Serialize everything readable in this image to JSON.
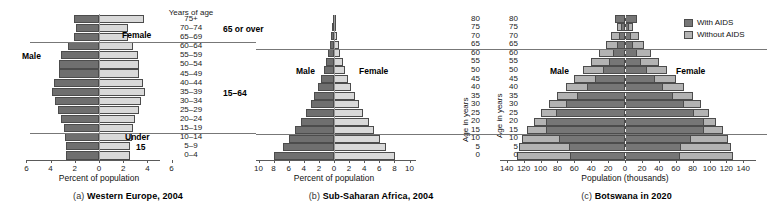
{
  "figure": {
    "panels": [
      {
        "id": "(a)",
        "caption": "Western Europe, 2004",
        "male_label": "Male",
        "female_label": "Female",
        "age_axis_header": "Years of age",
        "x_axis_title": "Percent of population",
        "group_labels": {
          "over65": "65 or over",
          "mid": "15–64",
          "under15_line1": "Under",
          "under15_line2": "15"
        }
      },
      {
        "id": "(b)",
        "caption": "Sub-Saharan Africa, 2004",
        "male_label": "Male",
        "female_label": "Female",
        "x_axis_title": "Percent of population",
        "y_axis_title": "Age in years"
      },
      {
        "id": "(c)",
        "caption": "Botswana in 2020",
        "male_label": "Male",
        "female_label": "Female",
        "x_axis_title": "Population (thousands)",
        "y_axis_title": "Age in years",
        "legend": [
          {
            "label": "With AIDS",
            "swatch": "with-aids-swatch"
          },
          {
            "label": "Without AIDS",
            "swatch": "without-aids-swatch"
          }
        ]
      }
    ]
  },
  "colors": {
    "male_dark": "#6f6f6f",
    "female_light": "#d9d9d9",
    "with_aids": "#767676",
    "without_aids": "#b3b3b3",
    "axis": "#5a5a5a",
    "divider": "#777777"
  },
  "chart_data": [
    {
      "type": "bar",
      "title": "Western Europe, 2004",
      "subtitle": "(a)",
      "orientation": "horizontal-pyramid",
      "xlabel": "Percent of population",
      "ylabel": "Years of age",
      "xlim": [
        -6,
        6
      ],
      "xticks": [
        6,
        4,
        2,
        0,
        2,
        4,
        6
      ],
      "grid": false,
      "legend_position": "none",
      "categories": [
        "0–4",
        "5–9",
        "10–14",
        "15–19",
        "20–24",
        "25–29",
        "30–34",
        "35–39",
        "40–44",
        "45–49",
        "50–54",
        "55–59",
        "60–64",
        "65–69",
        "70–74",
        "75+"
      ],
      "series": [
        {
          "name": "Male",
          "values": [
            2.7,
            2.7,
            2.8,
            2.9,
            3.1,
            3.4,
            3.6,
            3.9,
            3.7,
            3.3,
            3.3,
            3.1,
            2.6,
            2.1,
            1.9,
            2.1
          ]
        },
        {
          "name": "Female",
          "values": [
            2.6,
            2.6,
            2.7,
            2.8,
            3.0,
            3.3,
            3.5,
            3.8,
            3.6,
            3.3,
            3.3,
            3.2,
            2.8,
            2.4,
            2.4,
            3.7
          ]
        }
      ],
      "annotations": [
        "Male",
        "Female",
        "65 or over",
        "15–64",
        "Under 15"
      ]
    },
    {
      "type": "bar",
      "title": "Sub-Saharan Africa, 2004",
      "subtitle": "(b)",
      "orientation": "horizontal-pyramid",
      "xlabel": "Percent of population",
      "ylabel": "Age in years",
      "xlim": [
        -10,
        10
      ],
      "xticks": [
        10,
        8,
        6,
        4,
        2,
        0,
        2,
        4,
        6,
        8,
        10
      ],
      "grid": false,
      "legend_position": "none",
      "categories": [
        "0",
        "5",
        "10",
        "15",
        "20",
        "25",
        "30",
        "35",
        "40",
        "45",
        "50",
        "55",
        "60",
        "65",
        "70",
        "75",
        "80"
      ],
      "series": [
        {
          "name": "Male",
          "values": [
            7.9,
            6.8,
            5.9,
            5.1,
            4.4,
            3.7,
            3.1,
            2.6,
            2.1,
            1.7,
            1.3,
            1.0,
            0.75,
            0.5,
            0.35,
            0.22,
            0.12
          ]
        },
        {
          "name": "Female",
          "values": [
            8.1,
            6.9,
            6.1,
            5.3,
            4.6,
            3.9,
            3.3,
            2.8,
            2.3,
            1.9,
            1.5,
            1.15,
            0.85,
            0.6,
            0.42,
            0.28,
            0.15
          ]
        }
      ],
      "annotations": [
        "Male",
        "Female"
      ]
    },
    {
      "type": "bar",
      "title": "Botswana in 2020",
      "subtitle": "(c)",
      "orientation": "horizontal-pyramid-overlay",
      "xlabel": "Population (thousands)",
      "ylabel": "Age in years",
      "xlim": [
        -140,
        140
      ],
      "xticks": [
        140,
        120,
        100,
        80,
        60,
        40,
        20,
        0,
        20,
        40,
        60,
        80,
        100,
        120,
        140
      ],
      "grid": false,
      "legend_position": "top-right",
      "categories": [
        "0",
        "5",
        "10",
        "15",
        "20",
        "25",
        "30",
        "35",
        "40",
        "45",
        "50",
        "55",
        "60",
        "65",
        "70",
        "75",
        "80"
      ],
      "series": [
        {
          "name": "Male without AIDS",
          "values": [
            128,
            126,
            122,
            116,
            108,
            99,
            90,
            80,
            70,
            60,
            50,
            40,
            31,
            23,
            16,
            10,
            6
          ]
        },
        {
          "name": "Male with AIDS",
          "values": [
            65,
            66,
            78,
            93,
            93,
            82,
            70,
            57,
            45,
            35,
            26,
            19,
            14,
            10,
            7,
            5,
            12
          ]
        },
        {
          "name": "Female without AIDS",
          "values": [
            128,
            126,
            122,
            116,
            108,
            99,
            90,
            80,
            70,
            60,
            50,
            40,
            31,
            23,
            16,
            10,
            6
          ]
        },
        {
          "name": "Female with AIDS",
          "values": [
            65,
            66,
            78,
            93,
            93,
            82,
            70,
            57,
            45,
            35,
            26,
            19,
            14,
            10,
            7,
            5,
            14
          ]
        }
      ],
      "annotations": [
        "Male",
        "Female",
        "With AIDS",
        "Without AIDS"
      ]
    }
  ]
}
